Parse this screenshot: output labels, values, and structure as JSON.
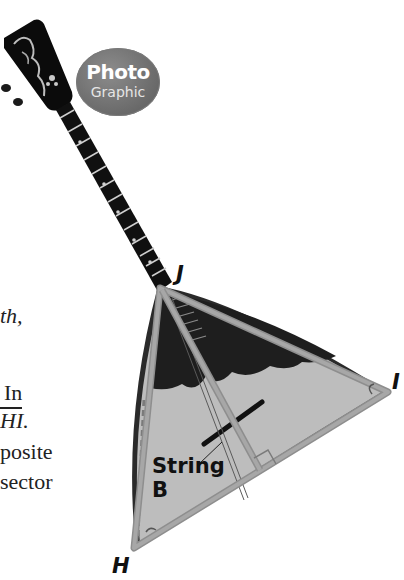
{
  "badge": {
    "line1": "Photo",
    "line2": "Graphic",
    "color": "#6e6e6e"
  },
  "text_fragments": [
    {
      "text": "th,",
      "style": "italic"
    },
    {
      "text": "In",
      "style": "normal"
    },
    {
      "text": "HI.",
      "style": "italic",
      "overline_on": "HI"
    },
    {
      "text": "posite",
      "style": "normal"
    },
    {
      "text": "sector",
      "style": "normal"
    }
  ],
  "figure": {
    "vertices": {
      "J": "J",
      "I": "I",
      "H": "H"
    },
    "string_label_line1": "String",
    "string_label_line2": "B",
    "right_angle_marker": true
  }
}
